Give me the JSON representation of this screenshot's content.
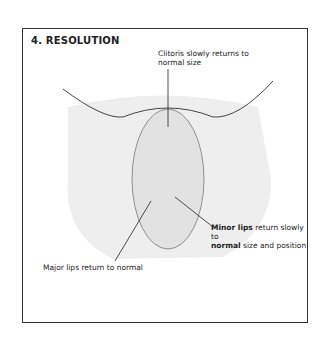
{
  "figure": {
    "title": "4. RESOLUTION",
    "labels": {
      "top": "Clitoris slowly returns to normal size",
      "right_bold_1": "Minor lips",
      "right_rest_1": " return slowly to",
      "right_bold_2": "normal",
      "right_rest_2": " size and position",
      "left": "Major lips return to normal"
    }
  }
}
